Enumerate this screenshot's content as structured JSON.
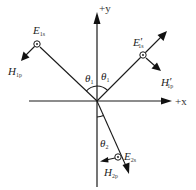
{
  "diagram": {
    "axes": {
      "x_label": "+x",
      "y_label": "+y"
    },
    "angles": {
      "incident": {
        "symbol": "θ",
        "subscript": "1"
      },
      "reflected": {
        "symbol": "θ",
        "subscript": "1"
      },
      "transmitted": {
        "symbol": "θ",
        "subscript": "2"
      }
    },
    "fields": {
      "incident_E": {
        "symbol": "E",
        "prime": "",
        "subscript": "1s"
      },
      "incident_H": {
        "symbol": "H",
        "prime": "",
        "subscript": "1p"
      },
      "reflected_E": {
        "symbol": "E",
        "prime": "′",
        "subscript": "1s"
      },
      "reflected_H": {
        "symbol": "H",
        "prime": "′",
        "subscript": "1p"
      },
      "transmitted_E": {
        "symbol": "E",
        "prime": "",
        "subscript": "2s"
      },
      "transmitted_H": {
        "symbol": "H",
        "prime": "",
        "subscript": "2p"
      }
    },
    "colors": {
      "stroke": "#1a1a1a",
      "background": "#ffffff"
    }
  }
}
